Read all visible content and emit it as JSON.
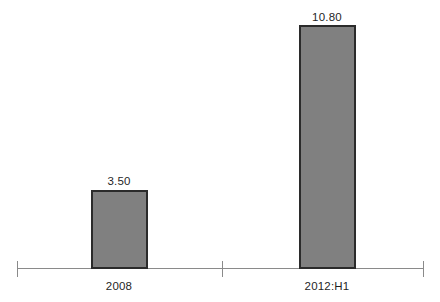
{
  "chart_data": {
    "type": "bar",
    "title": "",
    "subtitle": "",
    "xlabel": "",
    "ylabel": "",
    "categories": [
      "2008",
      "2012:H1"
    ],
    "values": [
      3.5,
      10.8
    ],
    "value_labels": [
      "3.50",
      "10.80"
    ],
    "ylim": [
      0,
      12
    ],
    "grid": false,
    "legend": false,
    "legend_position": "none",
    "axis": {
      "x_axis_visible": true,
      "y_axis_visible": false,
      "tick_count": 3,
      "tick_labels": [
        "",
        "",
        ""
      ]
    },
    "series": [
      {
        "name": "",
        "values": [
          3.5,
          10.8
        ]
      }
    ],
    "colors": {
      "bar_fill": "#808080",
      "bar_border": "#2b2b2b",
      "axis": "#8a8a8a",
      "text": "#1f1f1f",
      "background": "#ffffff"
    }
  }
}
